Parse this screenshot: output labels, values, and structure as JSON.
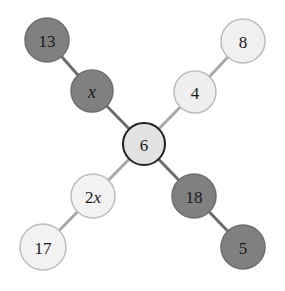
{
  "diagram": {
    "type": "node-link-graph",
    "title": "",
    "background_color": "#ffffff",
    "palette": {
      "dark_fill": "#808080",
      "dark_stroke": "#6e6e6e",
      "light_fill": "#e2e2e2",
      "light_stroke": "#b3b3b3",
      "pale_fill": "#f0f0f0",
      "pale_stroke": "#bdbdbd",
      "center_fill": "#e2e2e2",
      "center_stroke": "#1f1f1f",
      "edge_dark": "#6b6b6b",
      "edge_light": "#a8a8a8",
      "label_color": "#1a1a1a"
    },
    "nodes": [
      {
        "id": "n13",
        "label": "13",
        "label_style": "plain",
        "cx": 47,
        "cy": 40,
        "r": 22,
        "fill": "#808080",
        "stroke": "#6e6e6e",
        "stroke_width": 1.5
      },
      {
        "id": "nx",
        "label": "x",
        "label_style": "italic",
        "cx": 92,
        "cy": 91,
        "r": 21,
        "fill": "#808080",
        "stroke": "#6e6e6e",
        "stroke_width": 1.5
      },
      {
        "id": "n8",
        "label": "8",
        "label_style": "plain",
        "cx": 243,
        "cy": 41,
        "r": 22,
        "fill": "#f0f0f0",
        "stroke": "#bdbdbd",
        "stroke_width": 1.5
      },
      {
        "id": "n4",
        "label": "4",
        "label_style": "plain",
        "cx": 195,
        "cy": 92,
        "r": 21,
        "fill": "#efefef",
        "stroke": "#bdbdbd",
        "stroke_width": 1.5
      },
      {
        "id": "n6",
        "label": "6",
        "label_style": "plain",
        "cx": 144,
        "cy": 144,
        "r": 21,
        "fill": "#e2e2e2",
        "stroke": "#1f1f1f",
        "stroke_width": 2
      },
      {
        "id": "n2x",
        "label": "2x",
        "label_style": "mixed",
        "cx": 93,
        "cy": 196,
        "r": 22,
        "fill": "#f2f2f2",
        "stroke": "#bdbdbd",
        "stroke_width": 1.5
      },
      {
        "id": "n17",
        "label": "17",
        "label_style": "plain",
        "cx": 43,
        "cy": 247,
        "r": 23,
        "fill": "#f2f2f2",
        "stroke": "#bdbdbd",
        "stroke_width": 1.5
      },
      {
        "id": "n18",
        "label": "18",
        "label_style": "plain",
        "cx": 194,
        "cy": 196,
        "r": 22,
        "fill": "#808080",
        "stroke": "#6e6e6e",
        "stroke_width": 1.5
      },
      {
        "id": "n5",
        "label": "5",
        "label_style": "plain",
        "cx": 243,
        "cy": 247,
        "r": 22,
        "fill": "#808080",
        "stroke": "#6e6e6e",
        "stroke_width": 1.5
      }
    ],
    "edges": [
      {
        "id": "e13x",
        "from": "n13",
        "to": "nx",
        "color": "#6b6b6b",
        "width": 3
      },
      {
        "id": "ex6",
        "from": "nx",
        "to": "n6",
        "color": "#6b6b6b",
        "width": 3
      },
      {
        "id": "e86",
        "from": "n8",
        "to": "n4",
        "color": "#a8a8a8",
        "width": 3
      },
      {
        "id": "e46",
        "from": "n4",
        "to": "n6",
        "color": "#a8a8a8",
        "width": 3
      },
      {
        "id": "e62x",
        "from": "n6",
        "to": "n2x",
        "color": "#a8a8a8",
        "width": 3
      },
      {
        "id": "e2x17",
        "from": "n2x",
        "to": "n17",
        "color": "#a8a8a8",
        "width": 3
      },
      {
        "id": "e618",
        "from": "n6",
        "to": "n18",
        "color": "#6b6b6b",
        "width": 3
      },
      {
        "id": "e185",
        "from": "n18",
        "to": "n5",
        "color": "#6b6b6b",
        "width": 3
      }
    ]
  }
}
